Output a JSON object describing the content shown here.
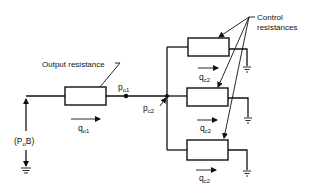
{
  "diagram": {
    "type": "pneumatic/hydraulic resistance network",
    "labels": {
      "output_resistance": "Output resistance",
      "control_resistances_line1": "Control",
      "control_resistances_line2": "resistances",
      "source": "(P",
      "source_sub": "o",
      "source_end": "B)",
      "p01_main": "p",
      "p01_sub": "o1",
      "pc2_main": "p",
      "pc2_sub": "c2",
      "q01_main": "q",
      "q01_sub": "o1",
      "qc2_main": "q",
      "qc2_sub": "c2"
    },
    "components": [
      {
        "id": "output-resistor",
        "label": "Output resistance"
      },
      {
        "id": "control-resistor-1"
      },
      {
        "id": "control-resistor-2"
      },
      {
        "id": "control-resistor-3"
      }
    ],
    "nodes": [
      "p_o1",
      "p_c2"
    ],
    "flows": [
      "q_o1",
      "q_c2",
      "q_c2",
      "q_c2"
    ],
    "grounds": 4
  }
}
